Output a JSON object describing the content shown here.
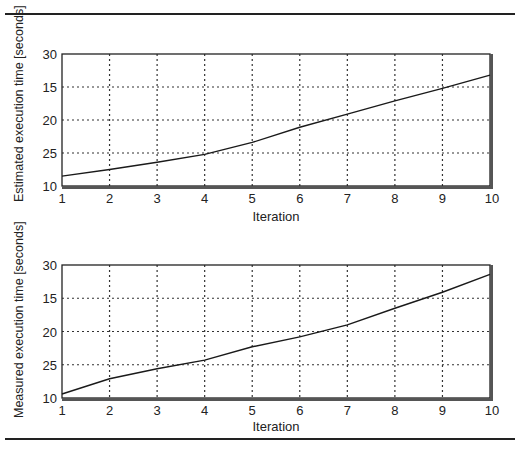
{
  "chart_data": [
    {
      "type": "line",
      "title": "",
      "xlabel": "Iteration",
      "ylabel": "Estimated execution time [seconds]",
      "x": [
        1,
        2,
        3,
        4,
        5,
        6,
        7,
        8,
        9,
        10
      ],
      "x_tick_labels": [
        "1",
        "2",
        "3",
        "4",
        "5",
        "6",
        "7",
        "8",
        "9",
        "10"
      ],
      "y_tick_labels_top_to_bottom": [
        "30",
        "15",
        "20",
        "25",
        "10"
      ],
      "series": [
        {
          "name": "Estimated execution time",
          "values": [
            11.5,
            12.5,
            13.6,
            14.8,
            16.6,
            18.9,
            20.9,
            22.9,
            24.8,
            26.8
          ]
        }
      ],
      "ylim": [
        10,
        30
      ],
      "grid": true,
      "legend": "none"
    },
    {
      "type": "line",
      "title": "",
      "xlabel": "Iteration",
      "ylabel": "Measured execution time [seconds]",
      "x": [
        1,
        2,
        3,
        4,
        5,
        6,
        7,
        8,
        9,
        10
      ],
      "x_tick_labels": [
        "1",
        "2",
        "3",
        "4",
        "5",
        "6",
        "7",
        "8",
        "9",
        "10"
      ],
      "y_tick_labels_top_to_bottom": [
        "30",
        "15",
        "20",
        "25",
        "10"
      ],
      "series": [
        {
          "name": "Measured execution time",
          "values": [
            10.6,
            12.9,
            14.4,
            15.7,
            17.7,
            19.2,
            21.0,
            23.5,
            25.9,
            28.6
          ]
        }
      ],
      "ylim": [
        10,
        30
      ],
      "grid": true,
      "legend": "none"
    }
  ],
  "colors": {
    "line": "#1a1a1a",
    "grid": "#333333",
    "frame": "#222222",
    "background": "#ffffff"
  }
}
